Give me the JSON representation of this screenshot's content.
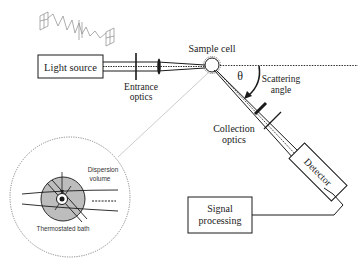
{
  "diagram": {
    "type": "light-scattering-setup",
    "components": {
      "light_source": {
        "label": "Light source"
      },
      "entrance_optics": {
        "label_line1": "Entrance",
        "label_line2": "optics"
      },
      "sample_cell": {
        "label": "Sample cell"
      },
      "scattering_angle": {
        "symbol": "θ",
        "label_line1": "Scattering",
        "label_line2": "angle"
      },
      "collection_optics": {
        "label_line1": "Collection",
        "label_line2": "optics"
      },
      "detector": {
        "label": "Detector"
      },
      "signal_processing": {
        "label_line1": "Signal",
        "label_line2": "processing"
      },
      "inset": {
        "dispersion_label_line1": "Dispersion",
        "dispersion_label_line2": "volume",
        "bath_label": "Thermostated bath"
      }
    },
    "colors": {
      "line": "#1a1a1a",
      "inset_fill": "#bdbdbd",
      "dotted_gray": "#9a9a9a",
      "wave_gray": "#8a8a8a"
    }
  }
}
